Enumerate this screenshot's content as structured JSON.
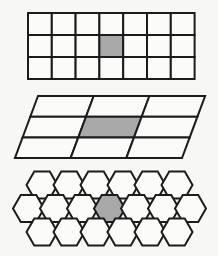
{
  "figure": {
    "background_color": "#f7f7f5",
    "stroke_color": "#1c1c1c",
    "tile_fill_color": "#fbfbf9",
    "highlight_fill_color": "#a8a8a8",
    "panel_count": 3
  },
  "panels": [
    {
      "name": "square-tiling",
      "shape": "square",
      "label": "Square tessellation",
      "columns": 7,
      "rows": 3,
      "highlight": {
        "column": 4,
        "row": 2
      },
      "tile_count": 21,
      "geometry": {
        "origin_x": 28,
        "origin_y": 13,
        "cell_width": 23.8,
        "cell_height": 22,
        "stroke_width": 2
      }
    },
    {
      "name": "rhombus-tiling",
      "shape": "parallelogram",
      "label": "Rhombus tessellation",
      "columns": 3,
      "rows": 3,
      "highlight": {
        "column": 2,
        "row": 2
      },
      "tile_count": 9,
      "geometry": {
        "top_left_x": 38,
        "top_y": 96,
        "bottom_left_x": 15,
        "bottom_y": 158,
        "cell_width": 55.7,
        "row_height": 20.7,
        "skew_per_row": 7.7,
        "stroke_width": 2
      }
    },
    {
      "name": "hexagon-tiling",
      "shape": "hexagon",
      "label": "Hexagonal tessellation",
      "orientation": "flat-top",
      "rows": 3,
      "row_counts": [
        6,
        7,
        6
      ],
      "highlight": {
        "row": 2,
        "index": 4
      },
      "tile_count": 19,
      "geometry": {
        "center_x_start": 42,
        "center_y_start": 185,
        "radius": 15.5,
        "row_step_y": 23.5,
        "col_step_x": 27,
        "stroke_width": 2
      }
    }
  ]
}
